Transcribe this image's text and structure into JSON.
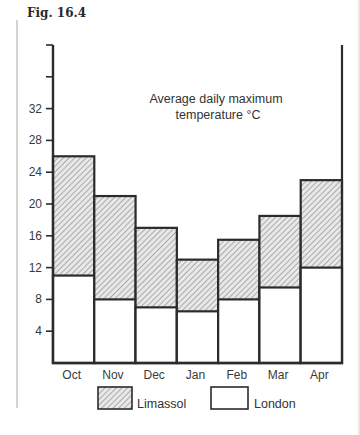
{
  "figure": {
    "caption": "Fig. 16.4"
  },
  "chart_data": {
    "type": "bar",
    "title": "Average daily maximum temperature °C",
    "annotation_lines": [
      "Average daily maximum",
      "temperature °C"
    ],
    "xlabel": "",
    "ylabel": "",
    "categories": [
      "Oct",
      "Nov",
      "Dec",
      "Jan",
      "Feb",
      "Mar",
      "Apr"
    ],
    "series": [
      {
        "name": "Limassol",
        "pattern": "diagonal-hatch",
        "values": [
          26,
          21,
          17,
          13,
          15.5,
          18.5,
          23
        ]
      },
      {
        "name": "London",
        "pattern": "plain-white",
        "values": [
          11,
          8,
          7,
          6.5,
          8,
          9.5,
          12
        ]
      }
    ],
    "overlay": "London bars drawn in front of Limassol bars (overlapping, not stacked)",
    "yticks": [
      4,
      8,
      12,
      16,
      20,
      24,
      28,
      32
    ],
    "unlabeled_yticks": [
      36,
      40
    ],
    "ylim": [
      0,
      40
    ],
    "grid": false,
    "legend_position": "bottom",
    "legend": [
      {
        "label": "Limassol",
        "swatch": "hatched"
      },
      {
        "label": "London",
        "swatch": "white"
      }
    ]
  },
  "colors": {
    "axis": "#2b2b2b",
    "hatch": "#8a8a8a",
    "hatch_bg": "#e6e6e6",
    "margin_line": "#b8b8b8"
  }
}
